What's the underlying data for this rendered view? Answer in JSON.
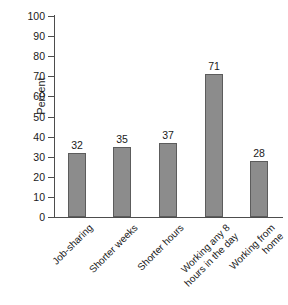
{
  "chart_data": {
    "type": "bar",
    "title": "",
    "subtitle": "",
    "xlabel": "",
    "ylabel": "Percent",
    "ylim": [
      0,
      100
    ],
    "ytick_step": 10,
    "grid": false,
    "legend": false,
    "bar_color": "#8c8c8c",
    "bar_edge_color": "#5c5c5c",
    "axis_color": "#4d4d4d",
    "background": "#ffffff",
    "categories": [
      "Job-sharing",
      "Shorter weeks",
      "Shorter hours",
      "Working any 8\nhours in the day",
      "Working from\nhome"
    ],
    "values": [
      32,
      35,
      37,
      71,
      28
    ],
    "value_labels": [
      "32",
      "35",
      "37",
      "71",
      "28"
    ],
    "ytick_labels": [
      "100",
      "90",
      "80",
      "70",
      "60",
      "50",
      "40",
      "30",
      "20",
      "10",
      "0"
    ],
    "yticks": [
      100,
      90,
      80,
      70,
      60,
      50,
      40,
      30,
      20,
      10,
      0
    ]
  }
}
